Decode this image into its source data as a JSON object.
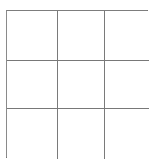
{
  "figure": {
    "type": "grid",
    "rows": 3,
    "columns": 3,
    "total_cells": 9,
    "background_color": "#ffffff",
    "cell_fill_color": "#ffffff",
    "line_color": "#7a7a7a",
    "line_width_px": 1,
    "outer_border_color": "#6f6f6f",
    "bottom_border_color": "#5f5f5f"
  },
  "grid": {
    "cells": [
      {
        "id": "cell-r1c1",
        "row": 1,
        "column": 1,
        "label": ""
      },
      {
        "id": "cell-r1c2",
        "row": 1,
        "column": 2,
        "label": ""
      },
      {
        "id": "cell-r1c3",
        "row": 1,
        "column": 3,
        "label": ""
      },
      {
        "id": "cell-r2c1",
        "row": 2,
        "column": 1,
        "label": ""
      },
      {
        "id": "cell-r2c2",
        "row": 2,
        "column": 2,
        "label": ""
      },
      {
        "id": "cell-r2c3",
        "row": 2,
        "column": 3,
        "label": ""
      },
      {
        "id": "cell-r3c1",
        "row": 3,
        "column": 1,
        "label": ""
      },
      {
        "id": "cell-r3c2",
        "row": 3,
        "column": 2,
        "label": ""
      },
      {
        "id": "cell-r3c3",
        "row": 3,
        "column": 3,
        "label": ""
      }
    ]
  }
}
